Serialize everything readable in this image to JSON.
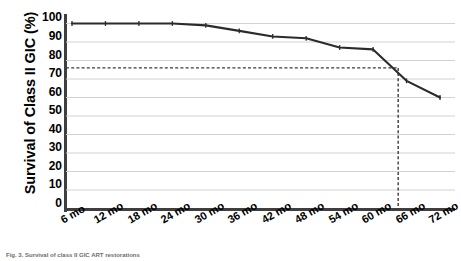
{
  "chart_data": {
    "type": "line",
    "title": "",
    "xlabel": "",
    "ylabel": "Survival of Class II GIC (%)",
    "categories": [
      "6 mo",
      "12 mo",
      "18 mo",
      "24 mo",
      "30 mo",
      "36 mo",
      "42 mo",
      "48 mo",
      "54 mo",
      "60 mo",
      "66 mo",
      "72 mo"
    ],
    "x": [
      6,
      12,
      18,
      24,
      30,
      36,
      42,
      48,
      54,
      60,
      66,
      72
    ],
    "values": [
      100,
      100,
      100,
      100,
      99,
      96,
      93,
      92,
      87,
      86,
      69,
      60
    ],
    "ylim": [
      0,
      100
    ],
    "xlim": [
      6,
      72
    ],
    "yticks": [
      0,
      10,
      20,
      30,
      40,
      50,
      60,
      70,
      80,
      90,
      100
    ],
    "ytick_labels": [
      "0",
      "10",
      "20",
      "30",
      "40",
      "50",
      "60",
      "70",
      "80",
      "90",
      "100"
    ],
    "grid": true,
    "grid_axis": "y",
    "legend": false,
    "legend_position": "none",
    "line_color": "#2b2b2b",
    "marker": "tick",
    "annotations": [
      {
        "name": "median-survival-reference",
        "type": "crosshair",
        "horizontal_value": 76,
        "vertical_value": 64.5,
        "style": "dashed",
        "color": "#3a3a3a"
      }
    ]
  },
  "axes": {
    "y_title": "Survival of Class II GIC (%)",
    "y_ticks": [
      "100",
      "90",
      "80",
      "70",
      "60",
      "50",
      "40",
      "30",
      "20",
      "10",
      "0"
    ],
    "x_ticks": [
      "6 mo",
      "12 mo",
      "18 mo",
      "24 mo",
      "30 mo",
      "36 mo",
      "42 mo",
      "48 mo",
      "54 mo",
      "60 mo",
      "66 mo",
      "72 mo"
    ]
  },
  "caption": {
    "text": "Fig. 3. Survival of class II GIC ART restorations"
  },
  "colors": {
    "line": "#2b2b2b",
    "grid": "#d2d2d2",
    "axis": "#3f3f3f",
    "dashed": "#3a3a3a",
    "text": "#000000"
  }
}
